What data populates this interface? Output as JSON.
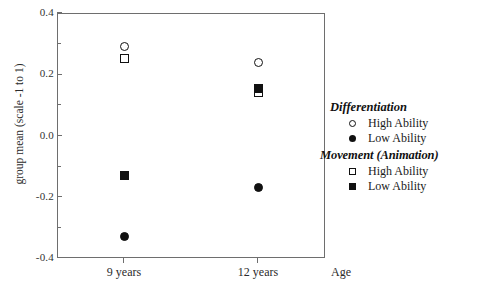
{
  "chart_data": {
    "type": "scatter",
    "title": "",
    "xlabel": "Age",
    "ylabel": "group mean (scale -1 to 1)",
    "categories": [
      "9 years",
      "12 years"
    ],
    "x": [
      1,
      2
    ],
    "xlim": [
      0.5,
      2.5
    ],
    "ylim": [
      -0.4,
      0.4
    ],
    "yticks": [
      "0.4",
      "0.2",
      "0.0",
      "-0.2",
      "-0.4"
    ],
    "ytick_values": [
      0.4,
      0.2,
      0.0,
      -0.2,
      -0.4
    ],
    "minor_yticks": [
      0.3,
      0.1,
      -0.1,
      -0.3
    ],
    "grid": false,
    "legend_position": "right",
    "series": [
      {
        "name": "Differentiation High Ability",
        "group": "Differentiation",
        "marker": "open-circle",
        "values": [
          0.29,
          0.24
        ]
      },
      {
        "name": "Differentiation Low Ability",
        "group": "Differentiation",
        "marker": "filled-circle",
        "values": [
          -0.33,
          -0.17
        ]
      },
      {
        "name": "Movement (Animation) High Ability",
        "group": "Movement (Animation)",
        "marker": "open-square",
        "values": [
          0.25,
          0.14
        ]
      },
      {
        "name": "Movement (Animation) Low Ability",
        "group": "Movement (Animation)",
        "marker": "filled-square",
        "values": [
          -0.13,
          0.155
        ]
      }
    ]
  },
  "axes": {
    "y_title": "group mean (scale -1 to 1)",
    "x_title": "Age",
    "y_tick_labels": [
      "0.4",
      "0.2",
      "0.0",
      "-0.2",
      "-0.4"
    ],
    "x_tick_labels": [
      "9 years",
      "12 years"
    ]
  },
  "legend": {
    "groups": [
      {
        "title": "Differentiation",
        "entries": [
          {
            "label": "High Ability",
            "marker": "open-circle"
          },
          {
            "label": "Low Ability",
            "marker": "filled-circle"
          }
        ]
      },
      {
        "title": "Movement  (Animation)",
        "entries": [
          {
            "label": "High Ability",
            "marker": "open-square"
          },
          {
            "label": "Low Ability",
            "marker": "filled-square"
          }
        ]
      }
    ]
  },
  "colors": {
    "marker": "#111111",
    "frame": "#6e6e6e",
    "text": "#1a1a1a",
    "background": "#ffffff"
  }
}
